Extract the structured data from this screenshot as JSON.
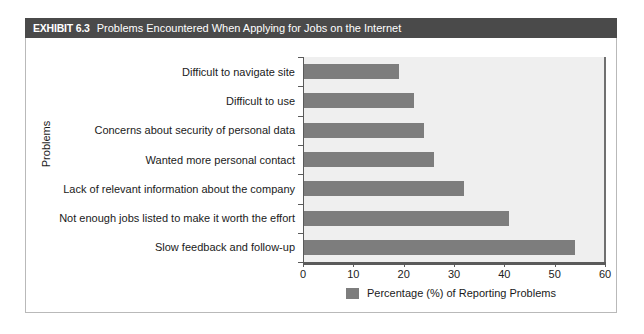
{
  "exhibit": {
    "tag": "EXHIBIT 6.3",
    "title": "Problems Encountered When Applying for Jobs on the Internet"
  },
  "colors": {
    "header_bar": "#4a4a4a",
    "bar_fill": "#7d7d7d",
    "plot_background": "#efefef",
    "frame_border": "#b9b9b9",
    "axis": "#5a5a5a"
  },
  "chart_data": {
    "type": "bar",
    "orientation": "horizontal",
    "title": "Problems Encountered When Applying for Jobs on the Internet",
    "categories": [
      "Difficult to navigate site",
      "Difficult to use",
      "Concerns about security of personal data",
      "Wanted more personal contact",
      "Lack of relevant information about the company",
      "Not enough jobs listed to make it worth the effort",
      "Slow feedback and follow-up"
    ],
    "values": [
      19,
      22,
      24,
      26,
      32,
      41,
      54
    ],
    "series": [
      {
        "name": "Percentage (%) of Reporting Problems",
        "values": [
          19,
          22,
          24,
          26,
          32,
          41,
          54
        ]
      }
    ],
    "xlabel": "",
    "ylabel": "Problems",
    "xlim": [
      0,
      60
    ],
    "xticks": [
      0,
      10,
      20,
      30,
      40,
      50,
      60
    ],
    "xtick_labels": [
      "0",
      "10",
      "20",
      "30",
      "40",
      "50",
      "60"
    ],
    "grid": false,
    "legend": {
      "position": "bottom",
      "entries": [
        "Percentage (%) of Reporting Problems"
      ]
    }
  }
}
